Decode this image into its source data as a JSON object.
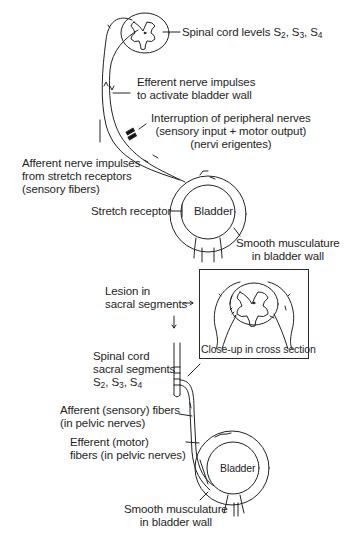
{
  "top_diagram": {
    "spinal_cord_label": "Spinal cord levels",
    "spinal_levels": [
      "S",
      "2",
      ", S",
      "3",
      ", S",
      "4"
    ],
    "efferent_line1": "Efferent nerve impulses",
    "efferent_line2": "to activate bladder wall",
    "interruption_line1": "Interruption of peripheral nerves",
    "interruption_line2": "(sensory input + motor output)",
    "interruption_line3": "(nervi erigentes)",
    "afferent_line1": "Afferent nerve impulses",
    "afferent_line2": "from stretch receptors",
    "afferent_line3": "(sensory fibers)",
    "stretch_receptor": "Stretch receptor",
    "bladder": "Bladder",
    "smooth_line1": "Smooth musculature",
    "smooth_line2": "in bladder wall"
  },
  "bottom_diagram": {
    "lesion_line1": "Lesion in",
    "lesion_line2": "sacral segments",
    "closeup_label": "Close-up in cross section",
    "cord_line1": "Spinal cord",
    "cord_line2": "sacral segments",
    "cord_levels": [
      "S",
      "2",
      ", S",
      "3",
      ", S",
      "4"
    ],
    "afferent_line1": "Afferent (sensory) fibers",
    "afferent_line2": "(in pelvic nerves)",
    "efferent_line1": "Efferent (motor)",
    "efferent_line2": "fibers (in pelvic nerves)",
    "bladder": "Bladder",
    "smooth_line1": "Smooth musculature",
    "smooth_line2": "in bladder wall"
  }
}
